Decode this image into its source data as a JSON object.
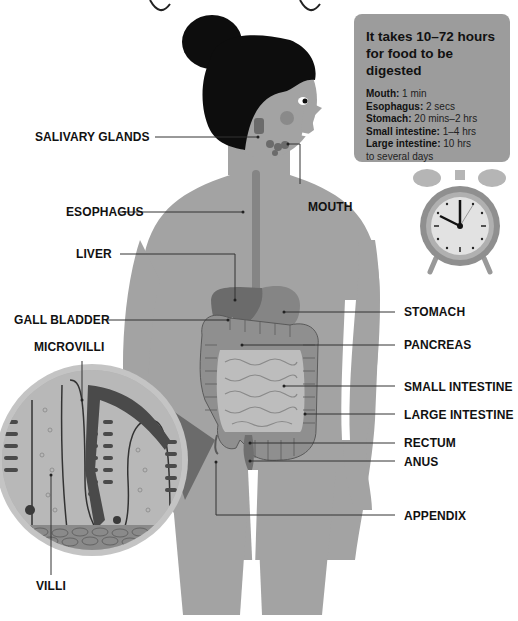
{
  "header": {
    "title_fragment": "... your digestive system ..."
  },
  "infobox": {
    "title": "It takes 10–72 hours for food to be digested",
    "rows": [
      {
        "organ": "Mouth:",
        "time": " 1 min"
      },
      {
        "organ": "Esophagus:",
        "time": " 2 secs"
      },
      {
        "organ": "Stomach:",
        "time": " 20 mins–2 hrs"
      },
      {
        "organ": "Small intestine:",
        "time": " 1–4 hrs"
      },
      {
        "organ": "Large intestine:",
        "time": " 10 hrs"
      },
      {
        "organ": "",
        "time": "to several days"
      }
    ],
    "background": "#9c9c9c"
  },
  "clock": {
    "icon": "alarm-clock-icon",
    "time_shown": "10:00"
  },
  "labels": {
    "salivary_glands": "SALIVARY GLANDS",
    "esophagus": "ESOPHAGUS",
    "mouth": "MOUTH",
    "liver": "LIVER",
    "gall_bladder": "GALL BLADDER",
    "microvilli": "MICROVILLI",
    "stomach": "STOMACH",
    "pancreas": "PANCREAS",
    "small_intestine": "SMALL INTESTINE",
    "large_intestine": "LARGE INTESTINE",
    "rectum": "RECTUM",
    "anus": "ANUS",
    "appendix": "APPENDIX",
    "villi": "VILLI"
  },
  "colors": {
    "body": "#a3a3a3",
    "hair": "#0d0d0d",
    "organ_dark": "#6b6b6b",
    "organ_mid": "#858585",
    "intestine_light": "#bdbdbd",
    "leader_line": "#333333"
  }
}
